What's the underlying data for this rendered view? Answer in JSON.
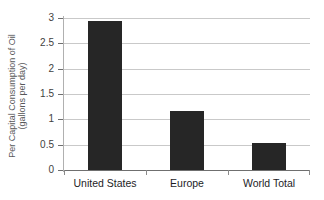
{
  "chart_data": {
    "type": "bar",
    "title": "",
    "xlabel": "",
    "ylabel_line1": "Per Capital Consumption of Oil",
    "ylabel_line2": "(gallons per day)",
    "categories": [
      "United States",
      "Europe",
      "World Total"
    ],
    "values": [
      2.95,
      1.16,
      0.53
    ],
    "ytick_labels": [
      "0",
      "0.5",
      "1",
      "1.5",
      "2",
      "2.5",
      "3"
    ],
    "ytick_values": [
      0,
      0.5,
      1,
      1.5,
      2,
      2.5,
      3
    ],
    "ylim": [
      0,
      3
    ],
    "grid": "horizontal",
    "legend": "none",
    "bar_color": "#262626",
    "grid_color": "#c9c9c9",
    "axis_color": "#6f6f6f",
    "text_color": "#1d1d1f",
    "label_color": "#58585a",
    "background": "#ffffff"
  }
}
